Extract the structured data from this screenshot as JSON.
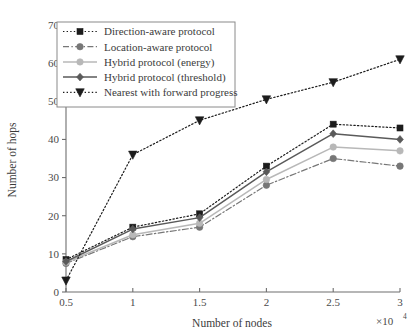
{
  "chart_data": {
    "type": "line",
    "title": "",
    "xlabel": "Number of nodes",
    "ylabel": "Number of hops",
    "x_multiplier_label": "×10",
    "x_multiplier_exponent": "4",
    "x": [
      0.5,
      1,
      1.5,
      2,
      2.5,
      3
    ],
    "xtick_labels": [
      "0.5",
      "1",
      "1.5",
      "2",
      "2.5",
      "3"
    ],
    "ytick_labels": [
      "0",
      "10",
      "20",
      "30",
      "40",
      "50",
      "60",
      "70"
    ],
    "yticks": [
      0,
      10,
      20,
      30,
      40,
      50,
      60,
      70
    ],
    "xlim": [
      0.5,
      3
    ],
    "ylim": [
      0,
      70
    ],
    "grid": false,
    "legend_position": "upper-left-inside",
    "series": [
      {
        "name": "Direction-aware protocol",
        "values": [
          8.5,
          17,
          20.5,
          33,
          44,
          43
        ],
        "color": "#1c1c1c",
        "line_style": "dotted",
        "marker": "square"
      },
      {
        "name": "Location-aware protocol",
        "values": [
          7.5,
          14.5,
          17,
          28,
          35,
          33
        ],
        "color": "#777777",
        "line_style": "dash-dot",
        "marker": "circle"
      },
      {
        "name": "Hybrid protocol (energy)",
        "values": [
          7.8,
          15,
          18,
          29.5,
          38,
          37
        ],
        "color": "#b8b8b8",
        "line_style": "solid",
        "marker": "circle"
      },
      {
        "name": "Hybrid protocol (threshold)",
        "values": [
          8,
          16.5,
          19.5,
          31.5,
          41.5,
          40
        ],
        "color": "#5a5a5a",
        "line_style": "solid",
        "marker": "diamond"
      },
      {
        "name": "Nearest with forward progress",
        "values": [
          3,
          36,
          45,
          50.5,
          55,
          61
        ],
        "color": "#1c1c1c",
        "line_style": "dotted",
        "marker": "triangle-down"
      }
    ]
  },
  "axes": {
    "y_title": "Number of hops",
    "x_title": "Number of nodes"
  }
}
